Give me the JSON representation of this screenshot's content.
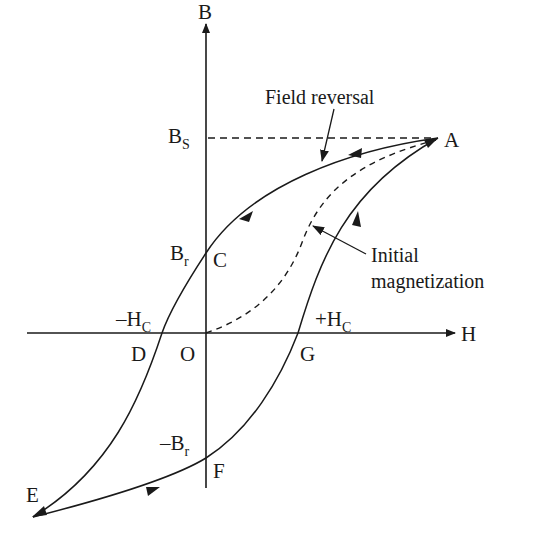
{
  "diagram": {
    "type": "magnetic hysteresis loop",
    "axes": {
      "x_label": "H",
      "y_label": "B"
    },
    "points": {
      "A": "A",
      "C": "C",
      "D": "D",
      "E": "E",
      "F": "F",
      "G": "G",
      "O": "O"
    },
    "axis_marks": {
      "saturation": {
        "base": "B",
        "sub": "S"
      },
      "remanence": {
        "base": "B",
        "sub": "r"
      },
      "neg_remanence": {
        "prefix": "–",
        "base": "B",
        "sub": "r"
      },
      "neg_coercivity": {
        "prefix": "–",
        "base": "H",
        "sub": "C"
      },
      "pos_coercivity": {
        "prefix": "+",
        "base": "H",
        "sub": "C"
      }
    },
    "annotations": {
      "field_reversal": "Field reversal",
      "initial_line1": "Initial",
      "initial_line2": "magnetization"
    },
    "colors": {
      "ink": "#1a1a1a",
      "background": "#ffffff"
    }
  }
}
